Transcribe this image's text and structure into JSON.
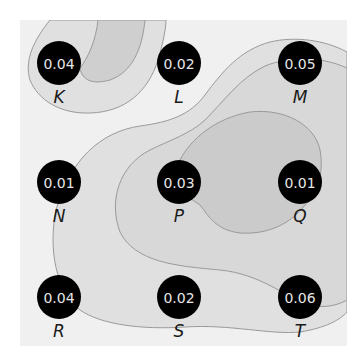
{
  "diagram": {
    "title": "",
    "colors": {
      "background": "#f0f0f0",
      "level1": "#e0e0e0",
      "level2": "#cfcfcf",
      "contour_line": "#9a9a9a",
      "node_fill": "#000000",
      "node_text": "#e6e6e6",
      "label_text": "#1a1a1a"
    },
    "nodes": [
      {
        "id": "K",
        "label": "K",
        "value": "0.04",
        "row": 0,
        "col": 0
      },
      {
        "id": "L",
        "label": "L",
        "value": "0.02",
        "row": 0,
        "col": 1
      },
      {
        "id": "M",
        "label": "M",
        "value": "0.05",
        "row": 0,
        "col": 2
      },
      {
        "id": "N",
        "label": "N",
        "value": "0.01",
        "row": 1,
        "col": 0
      },
      {
        "id": "P",
        "label": "P",
        "value": "0.03",
        "row": 1,
        "col": 1
      },
      {
        "id": "Q",
        "label": "Q",
        "value": "0.01",
        "row": 1,
        "col": 2
      },
      {
        "id": "R",
        "label": "R",
        "value": "0.04",
        "row": 2,
        "col": 0
      },
      {
        "id": "S",
        "label": "S",
        "value": "0.02",
        "row": 2,
        "col": 1
      },
      {
        "id": "T",
        "label": "T",
        "value": "0.06",
        "row": 2,
        "col": 2
      }
    ]
  }
}
